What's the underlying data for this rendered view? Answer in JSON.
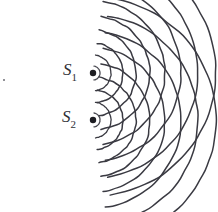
{
  "figure": {
    "background_color": "#ffffff",
    "stroke_color": "#3a3a42",
    "label_color": "#2f2f36",
    "width": 218,
    "height": 212
  },
  "sources": [
    {
      "id": "S1",
      "label_main": "S",
      "label_sub": "1",
      "dot_x": 93,
      "dot_y": 73,
      "dot_radius": 3.2,
      "label_x": 63,
      "label_y": 61
    },
    {
      "id": "S2",
      "label_main": "S",
      "label_sub": "2",
      "dot_x": 93,
      "dot_y": 120,
      "dot_radius": 3.2,
      "label_x": 62,
      "label_y": 108
    }
  ],
  "wavefronts": {
    "description": "Concentric circular arcs opening to the right from each point source",
    "radii": [
      7,
      18,
      30,
      43,
      57,
      72,
      88,
      105,
      123
    ],
    "arc_half_angle_deg": 82,
    "stroke_width": 1.5,
    "stroke_color": "#3a3a42",
    "count_per_source": 9
  },
  "artifacts": [
    {
      "name": "stray-dot",
      "x": 4,
      "y": 80,
      "size": 2,
      "color": "#6d6d75"
    }
  ],
  "chart_data": {
    "type": "scatter",
    "xlabel": "",
    "ylabel": "",
    "series": [
      {
        "name": "S1 wavefronts",
        "center": [
          93,
          73
        ],
        "radii": [
          7,
          18,
          30,
          43,
          57,
          72,
          88,
          105,
          123
        ]
      },
      {
        "name": "S2 wavefronts",
        "center": [
          93,
          120
        ],
        "radii": [
          7,
          18,
          30,
          43,
          57,
          72,
          88,
          105,
          123
        ]
      }
    ],
    "annotations": [
      "S1",
      "S2"
    ]
  }
}
